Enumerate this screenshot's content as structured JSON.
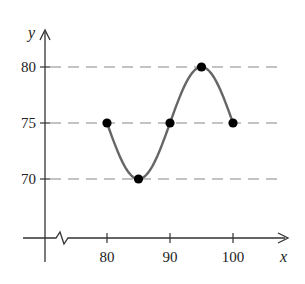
{
  "figure_label": "34.",
  "chart_data": {
    "type": "line",
    "title": "",
    "xlabel": "x",
    "ylabel": "y",
    "x": [
      80,
      85,
      90,
      95,
      100
    ],
    "series": [
      {
        "name": "curve",
        "values": [
          75,
          70,
          75,
          80,
          75
        ],
        "smooth": true,
        "markers": true
      }
    ],
    "x_ticks": [
      80,
      90,
      100
    ],
    "y_ticks": [
      70,
      75,
      80
    ],
    "x_tick_labels": [
      "80",
      "90",
      "100"
    ],
    "y_tick_labels": [
      "70",
      "75",
      "80"
    ],
    "xlim": [
      70,
      105
    ],
    "ylim": [
      64,
      82
    ],
    "grid": {
      "horizontal_dashed_at": [
        70,
        75,
        80
      ]
    },
    "axis_break": "x-axis break between origin and 80",
    "legend": null
  },
  "style": {
    "curve_color": "#666666",
    "marker_color": "#000000",
    "grid_color": "#888888",
    "axis_color": "#333333"
  }
}
